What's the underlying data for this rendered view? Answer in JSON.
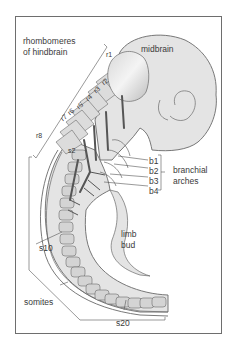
{
  "labels": {
    "rhombomeres": "rhombomeres",
    "of_hindbrain": "of hindbrain",
    "midbrain": "midbrain",
    "r1": "r1",
    "r2": "r2",
    "r3": "r3",
    "r4": "r4",
    "r5": "r5",
    "r6": "r6",
    "r7": "r7",
    "r8": "r8",
    "s2": "s2",
    "b1": "b1",
    "b2": "b2",
    "b3": "b3",
    "b4": "b4",
    "branchial": "branchial",
    "arches": "arches",
    "limb": "limb",
    "bud": "bud",
    "s10": "s10",
    "somites": "somites",
    "s20": "s20"
  },
  "colors": {
    "tissue": "#e4e4e4",
    "tissue_dark": "#c8c8c8",
    "outline": "#6a6a6a",
    "nerve": "#5a5a5a",
    "text": "#3a3a3a"
  }
}
